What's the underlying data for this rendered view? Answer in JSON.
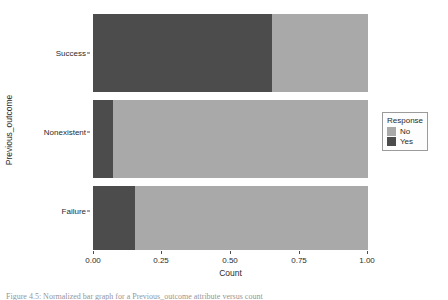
{
  "chart_data": {
    "type": "bar",
    "orientation": "horizontal",
    "stacked": true,
    "normalized": true,
    "title": "",
    "xlabel": "Count",
    "ylabel": "Previous_outcome",
    "categories": [
      "Success",
      "Nonexistent",
      "Failure"
    ],
    "category_order_top_to_bottom": [
      "Success",
      "Nonexistent",
      "Failure"
    ],
    "series": [
      {
        "name": "No",
        "color": "#a9a9a9",
        "values": [
          0.35,
          0.927,
          0.848
        ]
      },
      {
        "name": "Yes",
        "color": "#4c4c4c",
        "values": [
          0.65,
          0.073,
          0.152
        ]
      }
    ],
    "xlim": [
      0.0,
      1.0
    ],
    "xticks": [
      0.0,
      0.25,
      0.5,
      0.75,
      1.0
    ],
    "xtick_labels": [
      "0.00",
      "0.25",
      "0.50",
      "0.75",
      "1.00"
    ],
    "grid": false,
    "legend": {
      "title": "Response",
      "position": "right",
      "entries": [
        "No",
        "Yes"
      ]
    }
  },
  "legend": {
    "title": "Response",
    "items": [
      {
        "label": "No",
        "color": "#a9a9a9"
      },
      {
        "label": "Yes",
        "color": "#4c4c4c"
      }
    ]
  },
  "axes": {
    "x_title": "Count",
    "y_title": "Previous_outcome",
    "x_ticks": [
      "0.00",
      "0.25",
      "0.50",
      "0.75",
      "1.00"
    ],
    "y_ticks": [
      "Success",
      "Nonexistent",
      "Failure"
    ]
  },
  "caption": "Figure 4.5: Normalized bar graph for a Previous_outcome attribute versus count"
}
